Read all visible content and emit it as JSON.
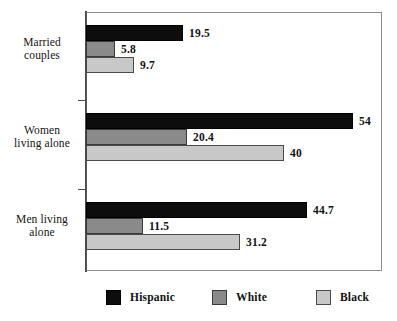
{
  "chart_data": {
    "type": "bar",
    "orientation": "horizontal",
    "title": "",
    "subtitle": "",
    "xlabel": "",
    "ylabel": "",
    "categories": [
      "Married couples",
      "Women living alone",
      "Men living alone"
    ],
    "category_labels_multiline": [
      [
        "Married",
        "couples"
      ],
      [
        "Women",
        "living alone"
      ],
      [
        "Men living",
        "alone"
      ]
    ],
    "series": [
      {
        "name": "Hispanic",
        "color": "#0d0d0d",
        "values": [
          19.5,
          54,
          44.7
        ],
        "value_labels": [
          "19.5",
          "54",
          "44.7"
        ]
      },
      {
        "name": "White",
        "color": "#8a8a8a",
        "values": [
          5.8,
          20.4,
          11.5
        ],
        "value_labels": [
          "5.8",
          "20.4",
          "11.5"
        ]
      },
      {
        "name": "Black",
        "color": "#c8c8c8",
        "values": [
          9.7,
          40,
          31.2
        ],
        "value_labels": [
          "9.7",
          "40",
          "31.2"
        ]
      }
    ],
    "xlim": [
      0,
      59.8
    ],
    "grid": false,
    "legend": {
      "position": "bottom",
      "entries": [
        "Hispanic",
        "White",
        "Black"
      ]
    },
    "axis_ticks_visible": false,
    "frame": true
  }
}
